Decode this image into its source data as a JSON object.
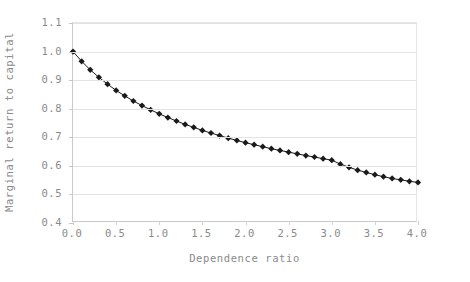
{
  "chart_data": {
    "type": "line",
    "title": "",
    "subtitle": "",
    "xlabel": "Dependence ratio",
    "ylabel": "Marginal return to capital",
    "xlim": [
      0.0,
      4.0
    ],
    "ylim": [
      0.4,
      1.1
    ],
    "grid": true,
    "legend": false,
    "marker": "filled-diamond",
    "series_color": "#1a1a1a",
    "grid_color": "#e3e3e3",
    "axis_color": "#c9c9c9",
    "text_color": "#8a8a8a",
    "x_ticks": [
      "0.0",
      "0.5",
      "1.0",
      "1.5",
      "2.0",
      "2.5",
      "3.0",
      "3.5",
      "4.0"
    ],
    "x_tick_values": [
      0.0,
      0.5,
      1.0,
      1.5,
      2.0,
      2.5,
      3.0,
      3.5,
      4.0
    ],
    "y_ticks": [
      "1.1",
      "1.0",
      "0.9",
      "0.8",
      "0.7",
      "0.6",
      "0.5",
      "0.4"
    ],
    "y_tick_values": [
      1.1,
      1.0,
      0.9,
      0.8,
      0.7,
      0.6,
      0.5,
      0.4
    ],
    "series": [
      {
        "name": "Marginal return to capital",
        "x": [
          0.0,
          0.1,
          0.2,
          0.3,
          0.4,
          0.5,
          0.6,
          0.7,
          0.8,
          0.9,
          1.0,
          1.1,
          1.2,
          1.3,
          1.4,
          1.5,
          1.6,
          1.7,
          1.8,
          1.9,
          2.0,
          2.1,
          2.2,
          2.3,
          2.4,
          2.5,
          2.6,
          2.7,
          2.8,
          2.9,
          3.0,
          3.1,
          3.2,
          3.3,
          3.4,
          3.5,
          3.6,
          3.7,
          3.8,
          3.9,
          4.0
        ],
        "values": [
          1.0,
          0.966,
          0.936,
          0.91,
          0.886,
          0.864,
          0.845,
          0.827,
          0.811,
          0.796,
          0.782,
          0.769,
          0.757,
          0.745,
          0.735,
          0.724,
          0.715,
          0.706,
          0.697,
          0.689,
          0.681,
          0.674,
          0.667,
          0.66,
          0.654,
          0.648,
          0.642,
          0.636,
          0.631,
          0.625,
          0.62,
          0.606,
          0.595,
          0.585,
          0.577,
          0.569,
          0.562,
          0.556,
          0.551,
          0.546,
          0.542
        ]
      }
    ]
  }
}
